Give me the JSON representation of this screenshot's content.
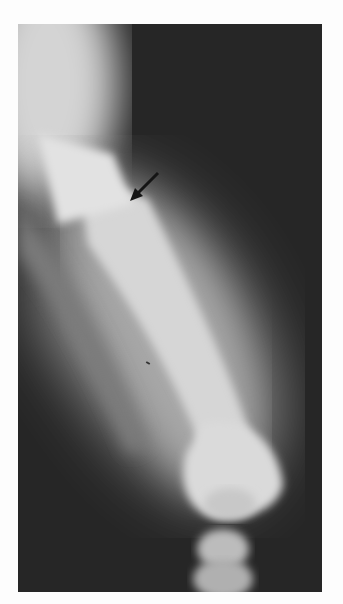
{
  "image": {
    "subject": "radiograph of femur and knee",
    "annotation": "arrow pointing to femoral shaft",
    "colors": {
      "background": "#fdfdfd",
      "film_dark": "#2a2a2a",
      "bone_light": "#dcdcdc",
      "arrow": "#1a1a1a"
    }
  }
}
